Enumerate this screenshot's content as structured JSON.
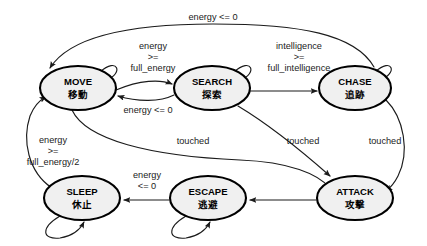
{
  "diagram": {
    "type": "state-machine",
    "title": "",
    "background_color": "#ffffff",
    "node_fill_color": "#f0f0f0",
    "node_stroke_color": "#000000",
    "edge_color": "#1b1b1b",
    "states": [
      {
        "id": "move",
        "label_en": "MOVE",
        "label_jp": "移動",
        "cx": 78,
        "cy": 88,
        "rx": 38,
        "ry": 22
      },
      {
        "id": "search",
        "label_en": "SEARCH",
        "label_jp": "探索",
        "cx": 212,
        "cy": 88,
        "rx": 38,
        "ry": 22
      },
      {
        "id": "chase",
        "label_en": "CHASE",
        "label_jp": "追跡",
        "cx": 355,
        "cy": 88,
        "rx": 36,
        "ry": 22
      },
      {
        "id": "sleep",
        "label_en": "SLEEP",
        "label_jp": "休止",
        "cx": 82,
        "cy": 198,
        "rx": 38,
        "ry": 22
      },
      {
        "id": "escape",
        "label_en": "ESCAPE",
        "label_jp": "逃避",
        "cx": 208,
        "cy": 198,
        "rx": 38,
        "ry": 22
      },
      {
        "id": "attack",
        "label_en": "ATTACK",
        "label_jp": "攻撃",
        "cx": 355,
        "cy": 198,
        "rx": 38,
        "ry": 22
      }
    ],
    "transitions": [
      {
        "id": "chase-to-move",
        "from": "chase",
        "to": "move",
        "label_lines": [
          "energy <= 0"
        ],
        "label_x": 213,
        "label_y": 18
      },
      {
        "id": "move-to-search",
        "from": "move",
        "to": "search",
        "label_lines": [
          "energy",
          ">=",
          "full_energy"
        ],
        "label_x": 153,
        "label_y": 58
      },
      {
        "id": "search-to-move",
        "from": "search",
        "to": "move",
        "label_lines": [
          "energy <= 0"
        ],
        "label_x": 148,
        "label_y": 110
      },
      {
        "id": "search-to-chase",
        "from": "search",
        "to": "chase",
        "label_lines": [
          "intelligence",
          ">=",
          "full_intelligence"
        ],
        "label_x": 296,
        "label_y": 58
      },
      {
        "id": "sleep-to-move",
        "from": "sleep",
        "to": "move",
        "label_lines": [
          "energy",
          ">=",
          "full_energy/2"
        ],
        "label_x": 53,
        "label_y": 152
      },
      {
        "id": "move-to-attack",
        "from": "move",
        "to": "attack",
        "label_lines": [
          "touched"
        ],
        "label_x": 193,
        "label_y": 141
      },
      {
        "id": "search-to-attack",
        "from": "search",
        "to": "attack",
        "label_lines": [
          "touched"
        ],
        "label_x": 302,
        "label_y": 141
      },
      {
        "id": "chase-to-attack",
        "from": "chase",
        "to": "attack",
        "label_lines": [
          "touched"
        ],
        "label_x": 385,
        "label_y": 141
      },
      {
        "id": "attack-to-escape",
        "from": "attack",
        "to": "escape",
        "label_lines": [],
        "label_x": 283,
        "label_y": 188
      },
      {
        "id": "escape-to-sleep",
        "from": "escape",
        "to": "sleep",
        "label_lines": [
          "energy",
          "<= 0"
        ],
        "label_x": 146,
        "label_y": 178
      }
    ],
    "self_loops": [
      {
        "id": "move-self",
        "state": "move"
      },
      {
        "id": "search-self",
        "state": "search"
      },
      {
        "id": "chase-self",
        "state": "chase"
      },
      {
        "id": "sleep-self",
        "state": "sleep"
      },
      {
        "id": "escape-self",
        "state": "escape"
      }
    ]
  }
}
